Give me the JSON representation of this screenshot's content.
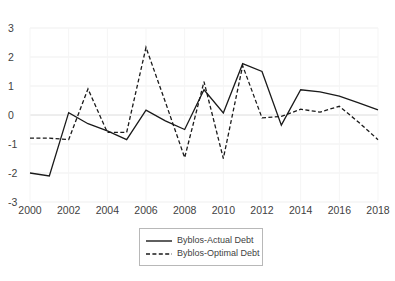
{
  "chart_data": {
    "type": "line",
    "title": "",
    "subtitle": "",
    "xlabel": "",
    "ylabel": "",
    "x": [
      2000,
      2001,
      2002,
      2003,
      2004,
      2005,
      2006,
      2007,
      2008,
      2009,
      2010,
      2011,
      2012,
      2013,
      2014,
      2015,
      2016,
      2017,
      2018
    ],
    "xlim": [
      2000,
      2018
    ],
    "ylim": [
      -3,
      3
    ],
    "y_ticks": [
      "3",
      "2",
      "1",
      "0",
      "-1",
      "-2",
      "-3"
    ],
    "y_tick_values": [
      3,
      2,
      1,
      0,
      -1,
      -2,
      -3
    ],
    "x_ticks": [
      "2000",
      "2002",
      "2004",
      "2006",
      "2008",
      "2010",
      "2012",
      "2014",
      "2016",
      "2018"
    ],
    "x_tick_values": [
      2000,
      2002,
      2004,
      2006,
      2008,
      2010,
      2012,
      2014,
      2016,
      2018
    ],
    "grid": true,
    "grid_color": "#e8e8e8",
    "legend_position": "bottom",
    "series": [
      {
        "name": "Byblos-Actual Debt",
        "style": "solid",
        "color": "#1a1a1a",
        "values": [
          -2.0,
          -2.1,
          0.08,
          -0.3,
          -0.55,
          -0.85,
          0.17,
          -0.2,
          -0.5,
          0.87,
          0.07,
          1.77,
          1.5,
          -0.35,
          0.87,
          0.8,
          0.65,
          0.42,
          0.18
        ]
      },
      {
        "name": "Byblos-Optimal Debt",
        "style": "dashed",
        "color": "#1a1a1a",
        "values": [
          -0.8,
          -0.8,
          -0.85,
          0.9,
          -0.6,
          -0.6,
          2.33,
          0.45,
          -1.47,
          1.15,
          -1.5,
          1.7,
          -0.1,
          -0.05,
          0.2,
          0.1,
          0.3,
          -0.25,
          -0.85
        ]
      }
    ]
  },
  "legend": {
    "items": [
      {
        "label": "Byblos-Actual Debt",
        "style": "solid"
      },
      {
        "label": "Byblos-Optimal Debt",
        "style": "dashed"
      }
    ]
  }
}
